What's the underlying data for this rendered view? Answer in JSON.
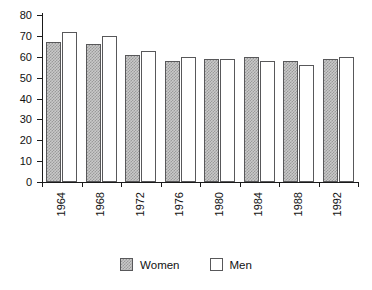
{
  "chart_data": {
    "type": "bar",
    "title": "",
    "xlabel": "",
    "ylabel": "",
    "categories": [
      "1964",
      "1968",
      "1972",
      "1976",
      "1980",
      "1984",
      "1988",
      "1992"
    ],
    "series": [
      {
        "name": "Women",
        "values": [
          67,
          66,
          61,
          58,
          59,
          60,
          58,
          59
        ]
      },
      {
        "name": "Men",
        "values": [
          72,
          70,
          63,
          60,
          59,
          58,
          56,
          60
        ]
      }
    ],
    "ylim": [
      0,
      80
    ],
    "ytick_step": 10,
    "yticks": [
      "0",
      "10",
      "20",
      "30",
      "40",
      "50",
      "60",
      "70",
      "80"
    ],
    "grid": false,
    "legend_position": "bottom",
    "xtick_rotation": 90,
    "colors": {
      "women_fill": "#c9c9c9",
      "women_hatch": "#9a9a9a",
      "men_fill": "#ffffff",
      "bar_outline": "#58585a",
      "axis": "#1a1a1a",
      "text": "#111111",
      "background": "#ffffff"
    }
  },
  "legend": {
    "items": [
      {
        "label": "Women",
        "style": "women"
      },
      {
        "label": "Men",
        "style": "men"
      }
    ]
  }
}
